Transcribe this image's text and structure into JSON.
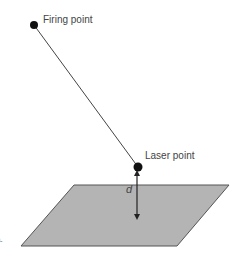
{
  "diagram": {
    "labels": {
      "firing_point": "Firing point",
      "laser_point": "Laser point",
      "distance": "d",
      "panel": "a."
    },
    "colors": {
      "plane_fill": "#b4b4b4",
      "plane_stroke": "#555555",
      "line": "#444444",
      "dot": "#111111",
      "text": "#444444"
    },
    "points": {
      "firing_point": [
        34,
        25
      ],
      "laser_point": [
        138,
        167
      ]
    },
    "plane_corners": [
      [
        74,
        185
      ],
      [
        229,
        185
      ],
      [
        177,
        246
      ],
      [
        21,
        246
      ]
    ]
  }
}
